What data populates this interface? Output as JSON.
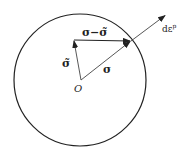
{
  "diagram": {
    "circle": {
      "cx": 80,
      "cy": 80,
      "r": 66
    },
    "origin": {
      "x": 81,
      "y": 80,
      "label": "O"
    },
    "vectors": {
      "sigma_tilde": {
        "label": "σ̃",
        "to": [
          74,
          40
        ]
      },
      "sigma": {
        "label": "σ",
        "to": [
          131,
          41
        ]
      },
      "difference": {
        "label": "σ−σ̃",
        "from": [
          74,
          40
        ],
        "to": [
          131,
          41
        ]
      },
      "plastic_strain_increment": {
        "label": "dε",
        "superscript": "p",
        "from": [
          131,
          41
        ],
        "to": [
          166,
          15
        ]
      }
    },
    "colors": {
      "stroke": "#222222",
      "background": "#ffffff"
    }
  }
}
